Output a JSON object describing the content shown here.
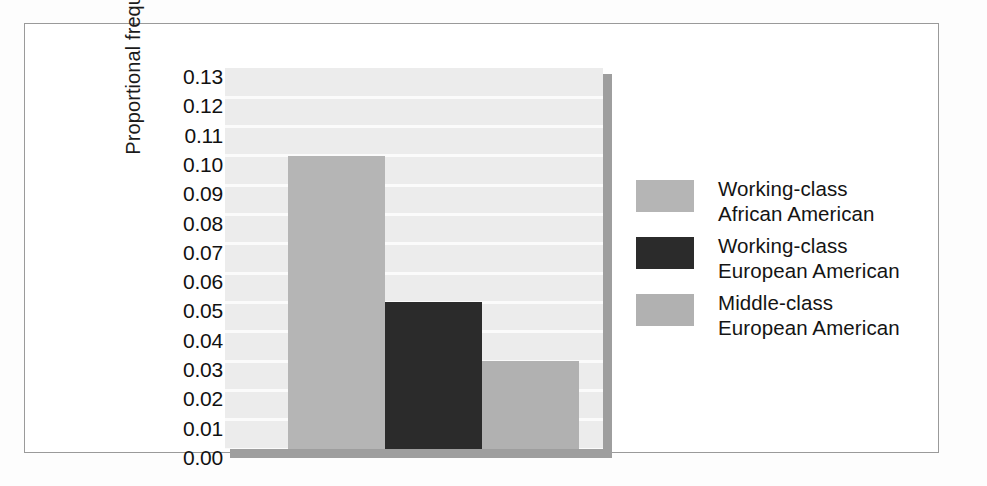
{
  "chart_data": {
    "type": "bar",
    "title": "",
    "xlabel": "",
    "ylabel": "Proportional frequency",
    "categories": [
      "Working-class African American",
      "Working-class European American",
      "Middle-class European American"
    ],
    "values": [
      0.1,
      0.05,
      0.03
    ],
    "ylim": [
      0.0,
      0.13
    ],
    "ytick_step": 0.01,
    "ytick_labels": [
      "0.13",
      "0.12",
      "0.11",
      "0.10",
      "0.09",
      "0.08",
      "0.07",
      "0.06",
      "0.05",
      "0.04",
      "0.03",
      "0.02",
      "0.01",
      "0.00"
    ],
    "grid": true,
    "grid_axis": "y",
    "legend_position": "right",
    "series": [
      {
        "name": "Working-class African American",
        "label_line1": "Working-class",
        "label_line2": "African American",
        "value": 0.1,
        "color": "#b5b5b5"
      },
      {
        "name": "Working-class European American",
        "label_line1": "Working-class",
        "label_line2": "European American",
        "value": 0.05,
        "color": "#2b2b2b"
      },
      {
        "name": "Middle-class European American",
        "label_line1": "Middle-class",
        "label_line2": "European American",
        "value": 0.03,
        "color": "#b1b1b1"
      }
    ]
  },
  "colors": {
    "plot_background": "#ececec",
    "gridline": "#fbfbfb",
    "shadow": "#9e9e9e",
    "frame_border": "#9a9a9a",
    "page_background": "#ffffff",
    "text": "#141414"
  }
}
